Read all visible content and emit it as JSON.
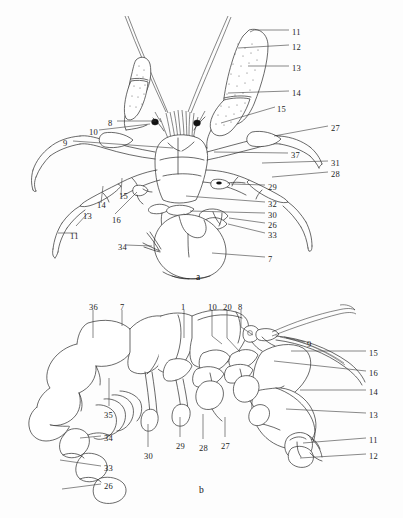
{
  "plate": {
    "background_color": "#fdfdfd",
    "ink_color": "#2a2a2a",
    "panels": [
      {
        "id": "a",
        "caption": "a",
        "view": "dorsal",
        "caption_pos": {
          "x": 196,
          "y": 272
        }
      },
      {
        "id": "b",
        "caption": "b",
        "view": "lateral",
        "caption_pos": {
          "x": 199,
          "y": 485
        }
      }
    ]
  },
  "figure_a": {
    "labels": [
      {
        "text": "11",
        "x": 292,
        "y": 28,
        "side": "right"
      },
      {
        "text": "12",
        "x": 292,
        "y": 43,
        "side": "right"
      },
      {
        "text": "13",
        "x": 292,
        "y": 64,
        "side": "right"
      },
      {
        "text": "14",
        "x": 292,
        "y": 89,
        "side": "right"
      },
      {
        "text": "15",
        "x": 277,
        "y": 105,
        "side": "right"
      },
      {
        "text": "27",
        "x": 331,
        "y": 124,
        "side": "right"
      },
      {
        "text": "37",
        "x": 291,
        "y": 151,
        "side": "right"
      },
      {
        "text": "31",
        "x": 331,
        "y": 159,
        "side": "right"
      },
      {
        "text": "28",
        "x": 331,
        "y": 170,
        "side": "right"
      },
      {
        "text": "29",
        "x": 268,
        "y": 183,
        "side": "right"
      },
      {
        "text": "32",
        "x": 268,
        "y": 200,
        "side": "right"
      },
      {
        "text": "30",
        "x": 268,
        "y": 211,
        "side": "right"
      },
      {
        "text": "26",
        "x": 268,
        "y": 221,
        "side": "right"
      },
      {
        "text": "33",
        "x": 268,
        "y": 231,
        "side": "right"
      },
      {
        "text": "7",
        "x": 268,
        "y": 255,
        "side": "right"
      },
      {
        "text": "8",
        "x": 108,
        "y": 119,
        "side": "left"
      },
      {
        "text": "10",
        "x": 89,
        "y": 128,
        "side": "left"
      },
      {
        "text": "9",
        "x": 63,
        "y": 139,
        "side": "left"
      },
      {
        "text": "15",
        "x": 119,
        "y": 192,
        "side": "left"
      },
      {
        "text": "14",
        "x": 97,
        "y": 201,
        "side": "left"
      },
      {
        "text": "13",
        "x": 83,
        "y": 212,
        "side": "left"
      },
      {
        "text": "16",
        "x": 112,
        "y": 216,
        "side": "left"
      },
      {
        "text": "11",
        "x": 70,
        "y": 232,
        "side": "left"
      },
      {
        "text": "34",
        "x": 118,
        "y": 243,
        "side": "left"
      }
    ]
  },
  "figure_b": {
    "labels": [
      {
        "text": "36",
        "x": 89,
        "y": 303,
        "side": "top"
      },
      {
        "text": "7",
        "x": 120,
        "y": 303,
        "side": "top"
      },
      {
        "text": "1",
        "x": 181,
        "y": 303,
        "side": "top"
      },
      {
        "text": "10",
        "x": 208,
        "y": 303,
        "side": "top"
      },
      {
        "text": "20",
        "x": 223,
        "y": 303,
        "side": "top"
      },
      {
        "text": "8",
        "x": 238,
        "y": 303,
        "side": "top"
      },
      {
        "text": "9",
        "x": 307,
        "y": 340,
        "side": "right"
      },
      {
        "text": "15",
        "x": 369,
        "y": 349,
        "side": "right"
      },
      {
        "text": "16",
        "x": 369,
        "y": 369,
        "side": "right"
      },
      {
        "text": "14",
        "x": 369,
        "y": 388,
        "side": "right"
      },
      {
        "text": "13",
        "x": 369,
        "y": 411,
        "side": "right"
      },
      {
        "text": "11",
        "x": 369,
        "y": 436,
        "side": "right"
      },
      {
        "text": "12",
        "x": 369,
        "y": 452,
        "side": "right"
      },
      {
        "text": "35",
        "x": 104,
        "y": 411,
        "side": "left"
      },
      {
        "text": "34",
        "x": 104,
        "y": 434,
        "side": "left"
      },
      {
        "text": "33",
        "x": 104,
        "y": 464,
        "side": "left"
      },
      {
        "text": "26",
        "x": 104,
        "y": 482,
        "side": "left"
      },
      {
        "text": "30",
        "x": 144,
        "y": 452,
        "side": "bottom"
      },
      {
        "text": "29",
        "x": 176,
        "y": 442,
        "side": "bottom"
      },
      {
        "text": "28",
        "x": 199,
        "y": 444,
        "side": "bottom"
      },
      {
        "text": "27",
        "x": 221,
        "y": 442,
        "side": "bottom"
      }
    ]
  }
}
